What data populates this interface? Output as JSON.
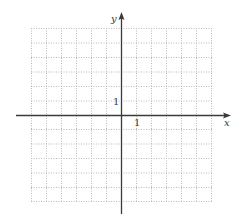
{
  "figure": {
    "type": "coordinate-plane",
    "axis_labels": {
      "x": "x",
      "y": "y"
    },
    "tick_labels": {
      "x_unit": "1",
      "y_unit": "1"
    },
    "grid": {
      "columns": 12,
      "rows": 12,
      "style": "dotted",
      "x_range": [
        -6,
        6
      ],
      "y_range": [
        -6,
        6
      ]
    },
    "colors": {
      "grid": "#b8b8b8",
      "axis": "#3a3a3a",
      "background": "#ffffff"
    }
  }
}
